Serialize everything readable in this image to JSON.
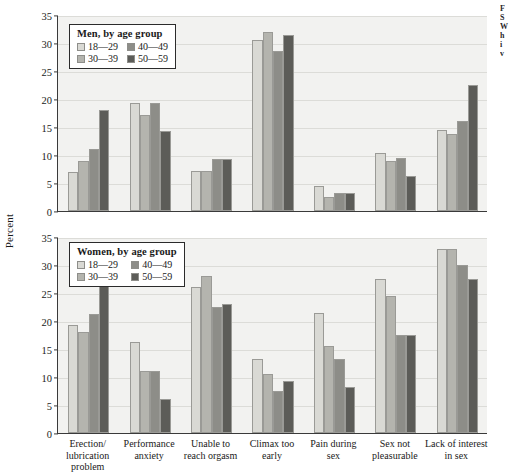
{
  "axis": {
    "ylabel": "Percent",
    "yticks": [
      0,
      5,
      10,
      15,
      20,
      25,
      30,
      35
    ],
    "ymin": 0,
    "ymax": 35
  },
  "legend": {
    "men_title": "Men, by age group",
    "women_title": "Women, by age group",
    "entries": [
      {
        "label": "18—29",
        "color": "#d9d9d4"
      },
      {
        "label": "40—49",
        "color": "#8d8d88"
      },
      {
        "label": "30—39",
        "color": "#b4b4ae"
      },
      {
        "label": "50—59",
        "color": "#5c5c58"
      }
    ]
  },
  "categories": [
    [
      "Erection/",
      "lubrication",
      "problem"
    ],
    [
      "Performance",
      "anxiety"
    ],
    [
      "Unable to",
      "reach orgasm"
    ],
    [
      "Climax too",
      "early"
    ],
    [
      "Pain during",
      "sex"
    ],
    [
      "Sex not",
      "pleasurable"
    ],
    [
      "Lack of interest",
      "in sex"
    ]
  ],
  "caption": [
    "F",
    "S",
    "W",
    "h",
    "i",
    "v"
  ],
  "chart_data": [
    {
      "type": "bar",
      "title": "Men, by age group",
      "xlabel": "",
      "ylabel": "Percent",
      "ylim": [
        0,
        35
      ],
      "grid": true,
      "legend_position": "top-left-inside",
      "categories": [
        "Erection/ lubrication problem",
        "Performance anxiety",
        "Unable to reach orgasm",
        "Climax too early",
        "Pain during sex",
        "Sex not pleasurable",
        "Lack of interest in sex"
      ],
      "series": [
        {
          "name": "18—29",
          "color": "#d9d9d4",
          "values": [
            7.0,
            19.2,
            7.2,
            30.5,
            4.5,
            10.3,
            14.5
          ]
        },
        {
          "name": "30—39",
          "color": "#b4b4ae",
          "values": [
            9.0,
            17.2,
            7.2,
            32.0,
            2.5,
            9.0,
            13.8
          ]
        },
        {
          "name": "40—49",
          "color": "#8d8d88",
          "values": [
            11.0,
            19.2,
            9.2,
            28.5,
            3.3,
            9.5,
            16.0
          ]
        },
        {
          "name": "50—59",
          "color": "#5c5c58",
          "values": [
            18.1,
            14.2,
            9.2,
            31.5,
            3.3,
            6.3,
            22.5
          ]
        }
      ]
    },
    {
      "type": "bar",
      "title": "Women, by age group",
      "xlabel": "",
      "ylabel": "Percent",
      "ylim": [
        0,
        35
      ],
      "grid": true,
      "legend_position": "top-left-inside",
      "categories": [
        "Erection/ lubrication problem",
        "Performance anxiety",
        "Unable to reach orgasm",
        "Climax too early",
        "Pain during sex",
        "Sex not pleasurable",
        "Lack of interest in sex"
      ],
      "series": [
        {
          "name": "18—29",
          "color": "#d9d9d4",
          "values": [
            19.2,
            16.2,
            26.0,
            13.3,
            21.5,
            27.5,
            32.8
          ]
        },
        {
          "name": "30—39",
          "color": "#b4b4ae",
          "values": [
            18.1,
            11.1,
            28.0,
            10.5,
            15.5,
            24.5,
            32.8
          ]
        },
        {
          "name": "40—49",
          "color": "#8d8d88",
          "values": [
            21.2,
            11.1,
            22.5,
            7.5,
            13.3,
            17.5,
            30.0
          ]
        },
        {
          "name": "50—59",
          "color": "#5c5c58",
          "values": [
            27.2,
            6.1,
            23.0,
            9.3,
            8.3,
            17.5,
            27.5
          ]
        }
      ]
    }
  ]
}
